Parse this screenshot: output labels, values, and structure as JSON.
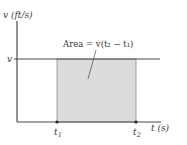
{
  "diagram": {
    "y_axis_label": "v (ft/s)",
    "x_axis_label": "t (s)",
    "v_level_label": "v",
    "area_label": "Area = v(t₂ − t₁)",
    "t1_label": "t",
    "t1_sub": "1",
    "t2_label": "t",
    "t2_sub": "2",
    "colors": {
      "axis": "#4a4a4a",
      "area_fill": "#dcdcdc",
      "text": "#3a3a3a"
    }
  }
}
